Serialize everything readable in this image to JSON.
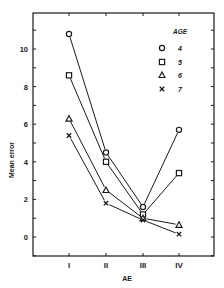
{
  "chart_data": {
    "type": "line",
    "title": "",
    "xlabel": "AE",
    "ylabel": "Mean error",
    "categories": [
      "I",
      "II",
      "III",
      "IV"
    ],
    "ylim": [
      -1,
      12
    ],
    "yticks": [
      0,
      2,
      4,
      6,
      8,
      10
    ],
    "grid": false,
    "legend_title": "AGE",
    "legend_position": "upper right",
    "series": [
      {
        "name": "4",
        "marker": "circle",
        "values": [
          10.8,
          4.5,
          1.6,
          5.7
        ]
      },
      {
        "name": "5",
        "marker": "square",
        "values": [
          8.6,
          4.0,
          1.2,
          3.4
        ]
      },
      {
        "name": "6",
        "marker": "triangle",
        "values": [
          6.3,
          2.5,
          1.0,
          0.65
        ]
      },
      {
        "name": "7",
        "marker": "x",
        "values": [
          5.4,
          1.8,
          0.9,
          0.15
        ]
      }
    ]
  },
  "colors": {
    "ink": "#1a1a1a",
    "background": "#ffffff"
  }
}
